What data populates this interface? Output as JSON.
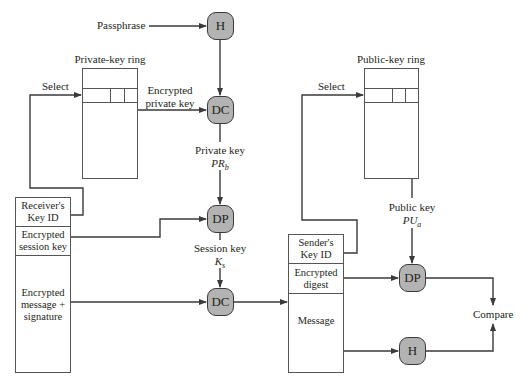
{
  "diagram": {
    "nodes": {
      "h_top": "H",
      "dc_top": "DC",
      "dp_left": "DP",
      "dc_bottom": "DC",
      "dp_right": "DP",
      "h_right": "H"
    },
    "labels": {
      "passphrase": "Passphrase",
      "private_key_ring": "Private-key ring",
      "public_key_ring": "Public-key ring",
      "select_left": "Select",
      "select_right": "Select",
      "encrypted_private_key_line1": "Encrypted",
      "encrypted_private_key_line2": "private key",
      "private_key": "Private key",
      "private_key_symbol": "PR",
      "private_key_sub": "b",
      "session_key": "Session key",
      "session_key_symbol": "K",
      "session_key_sub": "s",
      "public_key": "Public key",
      "public_key_symbol": "PU",
      "public_key_sub": "a",
      "compare": "Compare"
    },
    "received_message": {
      "fields": [
        {
          "line1": "Receiver's",
          "line2": "Key ID"
        },
        {
          "line1": "Encrypted",
          "line2": "session key"
        },
        {
          "line1": "Encrypted",
          "line2": "message +",
          "line3": "signature"
        }
      ]
    },
    "decrypted_message": {
      "fields": [
        {
          "line1": "Sender's",
          "line2": "Key ID"
        },
        {
          "line1": "Encrypted",
          "line2": "digest"
        },
        {
          "line1": "Message"
        }
      ]
    },
    "colors": {
      "node_fill": "#b3b3b3",
      "line": "#3a3a3a"
    }
  }
}
